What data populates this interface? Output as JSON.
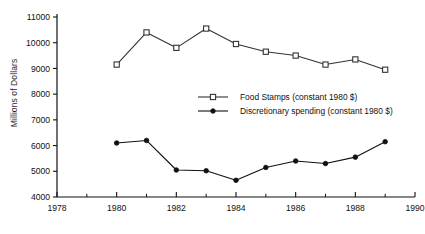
{
  "chart_data": {
    "type": "line",
    "title": "",
    "xlabel": "",
    "ylabel": "Millions of Dollars",
    "x": [
      1980,
      1981,
      1982,
      1983,
      1984,
      1985,
      1986,
      1987,
      1988,
      1989
    ],
    "xlim": [
      1978,
      1990
    ],
    "ylim": [
      4000,
      11000
    ],
    "xticks": [
      1978,
      1980,
      1982,
      1984,
      1986,
      1988,
      1990
    ],
    "xtick_labels": [
      "1978",
      "1980",
      "1982",
      "1984",
      "1986",
      "1988",
      "1990"
    ],
    "xminor_ticks": [
      1979,
      1981,
      1983,
      1985,
      1987,
      1989
    ],
    "yticks": [
      4000,
      5000,
      6000,
      7000,
      8000,
      9000,
      10000,
      11000
    ],
    "ytick_labels": [
      "4000",
      "5000",
      "6000",
      "7000",
      "8000",
      "9000",
      "10000",
      "11000"
    ],
    "grid": false,
    "legend_position": "center",
    "series": [
      {
        "name": "Food Stamps (constant 1980 $)",
        "marker": "open-square",
        "color": "#333333",
        "values": [
          9150,
          10400,
          9800,
          10550,
          9950,
          9650,
          9500,
          9150,
          9350,
          8950
        ]
      },
      {
        "name": "Discretionary spending (constant 1980 $)",
        "marker": "filled-circle",
        "color": "#111111",
        "values": [
          6100,
          6200,
          5050,
          5020,
          4650,
          5150,
          5400,
          5300,
          5550,
          6150
        ]
      }
    ]
  },
  "axis": {
    "y_title": "Millions of Dollars"
  },
  "legend": {
    "items": [
      {
        "label": "Food Stamps (constant 1980 $)"
      },
      {
        "label": "Discretionary spending (constant 1980 $)"
      }
    ]
  },
  "clipped_title": "· ·   ·   ·   ·"
}
